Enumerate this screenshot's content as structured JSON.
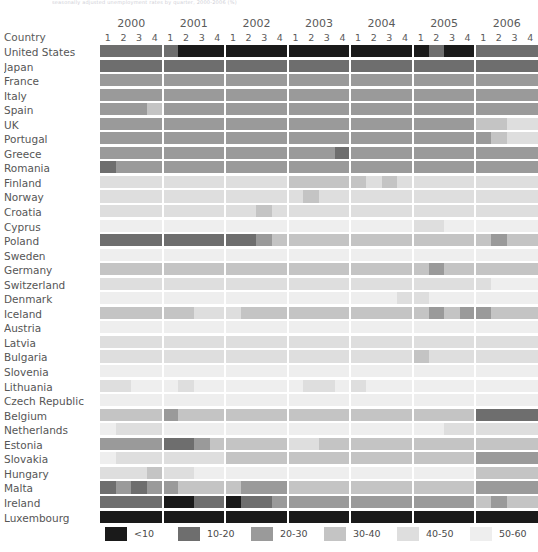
{
  "figure": {
    "cutoff_caption": "seasonally adjusted unemployment rates by quarter, 2000-2006 (%)",
    "row_header_label": "Country",
    "years": [
      "2000",
      "2001",
      "2002",
      "2003",
      "2004",
      "2005",
      "2006"
    ],
    "quarters": [
      "1",
      "2",
      "3",
      "4"
    ]
  },
  "legend": {
    "items": [
      {
        "label": "<10",
        "color": "#1a1a1a"
      },
      {
        "label": "10-20",
        "color": "#6e6e6e"
      },
      {
        "label": "20-30",
        "color": "#9a9a9a"
      },
      {
        "label": "30-40",
        "color": "#c4c4c4"
      },
      {
        "label": "40-50",
        "color": "#dedede"
      },
      {
        "label": "50-60",
        "color": "#eeeeee"
      }
    ]
  },
  "palette": {
    "b0": "#1a1a1a",
    "b1": "#6e6e6e",
    "b2": "#9a9a9a",
    "b3": "#c4c4c4",
    "b4": "#dedede",
    "b5": "#eeeeee",
    "b6": "#f7f7f7",
    "grid_background": "#ffffff"
  },
  "chart_data": {
    "type": "heatmap",
    "title": "Seasonally adjusted unemployment rates by quarter, 2000-2006 (%)",
    "xlabel": "",
    "ylabel": "Country",
    "legend_position": "bottom",
    "grid": true,
    "x": [
      "2000 Q1",
      "2000 Q2",
      "2000 Q3",
      "2000 Q4",
      "2001 Q1",
      "2001 Q2",
      "2001 Q3",
      "2001 Q4",
      "2002 Q1",
      "2002 Q2",
      "2002 Q3",
      "2002 Q4",
      "2003 Q1",
      "2003 Q2",
      "2003 Q3",
      "2003 Q4",
      "2004 Q1",
      "2004 Q2",
      "2004 Q3",
      "2004 Q4",
      "2005 Q1",
      "2005 Q2",
      "2005 Q3",
      "2005 Q4",
      "2006 Q1",
      "2006 Q2",
      "2006 Q3",
      "2006 Q4"
    ],
    "bins": [
      "<10",
      "10-20",
      "20-30",
      "30-40",
      "40-50",
      "50-60"
    ],
    "categories": [
      "United States",
      "Japan",
      "France",
      "Italy",
      "Spain",
      "UK",
      "Portugal",
      "Greece",
      "Romania",
      "Finland",
      "Norway",
      "Croatia",
      "Cyprus",
      "Poland",
      "Sweden",
      "Germany",
      "Switzerland",
      "Denmark",
      "Iceland",
      "Austria",
      "Latvia",
      "Bulgaria",
      "Slovenia",
      "Lithuania",
      "Czech Republic",
      "Belgium",
      "Netherlands",
      "Estonia",
      "Slovakia",
      "Hungary",
      "Malta",
      "Ireland",
      "Luxembourg"
    ],
    "rows": [
      {
        "country": "United States",
        "bins": [
          1,
          1,
          1,
          1,
          1,
          0,
          0,
          0,
          0,
          0,
          0,
          0,
          0,
          0,
          0,
          0,
          0,
          0,
          0,
          0,
          0,
          1,
          0,
          0,
          1,
          1,
          1,
          1
        ]
      },
      {
        "country": "Japan",
        "bins": [
          1,
          1,
          1,
          1,
          1,
          1,
          1,
          1,
          1,
          1,
          1,
          1,
          1,
          1,
          1,
          1,
          1,
          1,
          1,
          1,
          1,
          1,
          1,
          1,
          1,
          1,
          1,
          1
        ]
      },
      {
        "country": "France",
        "bins": [
          2,
          2,
          2,
          2,
          2,
          2,
          2,
          2,
          2,
          2,
          2,
          2,
          2,
          2,
          2,
          2,
          2,
          2,
          2,
          2,
          2,
          2,
          2,
          2,
          2,
          2,
          2,
          2
        ]
      },
      {
        "country": "Italy",
        "bins": [
          2,
          2,
          2,
          2,
          2,
          2,
          2,
          2,
          2,
          2,
          2,
          2,
          2,
          2,
          2,
          2,
          2,
          2,
          2,
          2,
          2,
          2,
          2,
          2,
          2,
          2,
          2,
          2
        ]
      },
      {
        "country": "Spain",
        "bins": [
          2,
          2,
          2,
          3,
          2,
          2,
          2,
          2,
          2,
          2,
          2,
          2,
          2,
          2,
          2,
          2,
          2,
          2,
          2,
          2,
          2,
          2,
          2,
          2,
          2,
          2,
          2,
          2
        ]
      },
      {
        "country": "UK",
        "bins": [
          2,
          2,
          2,
          2,
          2,
          2,
          2,
          2,
          2,
          2,
          2,
          2,
          2,
          2,
          2,
          2,
          2,
          2,
          2,
          2,
          2,
          2,
          2,
          2,
          3,
          3,
          4,
          4
        ]
      },
      {
        "country": "Portugal",
        "bins": [
          2,
          2,
          2,
          2,
          2,
          2,
          2,
          2,
          2,
          2,
          2,
          2,
          2,
          2,
          2,
          2,
          2,
          2,
          2,
          2,
          2,
          2,
          2,
          2,
          2,
          3,
          4,
          4
        ]
      },
      {
        "country": "Greece",
        "bins": [
          2,
          2,
          2,
          2,
          2,
          2,
          2,
          2,
          2,
          2,
          2,
          2,
          2,
          2,
          2,
          1,
          2,
          2,
          2,
          2,
          2,
          2,
          2,
          2,
          2,
          2,
          2,
          2
        ]
      },
      {
        "country": "Romania",
        "bins": [
          1,
          2,
          2,
          2,
          2,
          2,
          2,
          2,
          2,
          2,
          2,
          2,
          2,
          2,
          2,
          2,
          2,
          2,
          2,
          2,
          2,
          2,
          2,
          2,
          2,
          2,
          2,
          2
        ]
      },
      {
        "country": "Finland",
        "bins": [
          4,
          4,
          4,
          4,
          4,
          4,
          4,
          4,
          4,
          4,
          4,
          4,
          3,
          3,
          3,
          3,
          3,
          4,
          3,
          4,
          4,
          4,
          4,
          4,
          4,
          4,
          4,
          4
        ]
      },
      {
        "country": "Norway",
        "bins": [
          4,
          4,
          4,
          4,
          4,
          4,
          4,
          4,
          4,
          4,
          4,
          4,
          4,
          3,
          4,
          4,
          4,
          4,
          4,
          4,
          4,
          4,
          4,
          4,
          4,
          4,
          4,
          4
        ]
      },
      {
        "country": "Croatia",
        "bins": [
          4,
          4,
          4,
          4,
          4,
          4,
          4,
          4,
          4,
          4,
          3,
          4,
          4,
          4,
          4,
          4,
          4,
          4,
          4,
          4,
          4,
          4,
          4,
          4,
          4,
          4,
          4,
          4
        ]
      },
      {
        "country": "Cyprus",
        "bins": [
          5,
          5,
          5,
          5,
          5,
          5,
          5,
          5,
          5,
          5,
          5,
          5,
          5,
          5,
          5,
          5,
          5,
          5,
          5,
          5,
          4,
          4,
          5,
          5,
          5,
          5,
          5,
          5
        ]
      },
      {
        "country": "Poland",
        "bins": [
          1,
          1,
          1,
          1,
          1,
          1,
          1,
          1,
          1,
          1,
          2,
          3,
          3,
          3,
          3,
          3,
          3,
          3,
          3,
          3,
          3,
          3,
          3,
          3,
          3,
          2,
          3,
          3
        ]
      },
      {
        "country": "Sweden",
        "bins": [
          5,
          5,
          5,
          5,
          5,
          5,
          5,
          5,
          5,
          5,
          5,
          5,
          5,
          5,
          5,
          5,
          5,
          5,
          5,
          5,
          5,
          5,
          5,
          5,
          5,
          5,
          5,
          5
        ]
      },
      {
        "country": "Germany",
        "bins": [
          3,
          3,
          3,
          3,
          3,
          3,
          3,
          3,
          3,
          3,
          3,
          3,
          3,
          3,
          3,
          3,
          3,
          3,
          3,
          3,
          3,
          2,
          3,
          3,
          3,
          3,
          3,
          3
        ]
      },
      {
        "country": "Switzerland",
        "bins": [
          4,
          4,
          4,
          4,
          4,
          4,
          4,
          4,
          4,
          4,
          4,
          4,
          4,
          4,
          4,
          4,
          4,
          4,
          4,
          4,
          4,
          4,
          4,
          4,
          4,
          5,
          5,
          5
        ]
      },
      {
        "country": "Denmark",
        "bins": [
          5,
          5,
          5,
          5,
          5,
          5,
          5,
          5,
          5,
          5,
          5,
          5,
          5,
          5,
          5,
          5,
          5,
          5,
          5,
          4,
          4,
          5,
          5,
          5,
          5,
          5,
          5,
          5
        ]
      },
      {
        "country": "Iceland",
        "bins": [
          3,
          3,
          3,
          3,
          3,
          3,
          4,
          4,
          4,
          3,
          3,
          3,
          3,
          3,
          3,
          3,
          3,
          3,
          3,
          3,
          3,
          2,
          3,
          2,
          2,
          3,
          3,
          3
        ]
      },
      {
        "country": "Austria",
        "bins": [
          5,
          5,
          5,
          5,
          5,
          5,
          5,
          5,
          5,
          5,
          5,
          5,
          5,
          5,
          5,
          5,
          5,
          5,
          5,
          5,
          5,
          5,
          5,
          5,
          5,
          5,
          5,
          5
        ]
      },
      {
        "country": "Latvia",
        "bins": [
          4,
          4,
          4,
          4,
          4,
          4,
          4,
          4,
          4,
          4,
          4,
          4,
          4,
          4,
          4,
          4,
          4,
          4,
          4,
          4,
          4,
          4,
          4,
          4,
          4,
          4,
          4,
          4
        ]
      },
      {
        "country": "Bulgaria",
        "bins": [
          4,
          4,
          4,
          4,
          4,
          4,
          4,
          4,
          4,
          4,
          4,
          4,
          4,
          4,
          4,
          4,
          4,
          4,
          4,
          4,
          3,
          4,
          4,
          4,
          4,
          4,
          4,
          4
        ]
      },
      {
        "country": "Slovenia",
        "bins": [
          5,
          5,
          5,
          5,
          5,
          5,
          5,
          5,
          5,
          5,
          5,
          5,
          5,
          5,
          5,
          5,
          5,
          5,
          5,
          5,
          5,
          5,
          5,
          5,
          5,
          5,
          5,
          5
        ]
      },
      {
        "country": "Lithuania",
        "bins": [
          4,
          4,
          5,
          5,
          5,
          4,
          5,
          5,
          5,
          5,
          5,
          5,
          5,
          4,
          4,
          5,
          4,
          5,
          5,
          5,
          5,
          5,
          5,
          5,
          5,
          5,
          5,
          5
        ]
      },
      {
        "country": "Czech Republic",
        "bins": [
          5,
          5,
          5,
          5,
          5,
          5,
          5,
          5,
          5,
          5,
          5,
          5,
          5,
          5,
          5,
          5,
          5,
          5,
          5,
          5,
          5,
          5,
          5,
          5,
          5,
          5,
          5,
          5
        ]
      },
      {
        "country": "Belgium",
        "bins": [
          3,
          3,
          3,
          3,
          2,
          3,
          3,
          3,
          3,
          3,
          3,
          3,
          3,
          3,
          3,
          3,
          3,
          3,
          3,
          3,
          3,
          3,
          3,
          3,
          1,
          1,
          1,
          1
        ]
      },
      {
        "country": "Netherlands",
        "bins": [
          5,
          4,
          4,
          4,
          5,
          5,
          5,
          5,
          5,
          5,
          5,
          5,
          5,
          5,
          5,
          5,
          5,
          5,
          5,
          5,
          5,
          5,
          4,
          4,
          4,
          4,
          4,
          4
        ]
      },
      {
        "country": "Estonia",
        "bins": [
          2,
          2,
          2,
          2,
          1,
          1,
          2,
          3,
          3,
          3,
          3,
          3,
          4,
          4,
          3,
          3,
          3,
          3,
          3,
          3,
          3,
          3,
          3,
          3,
          3,
          3,
          3,
          3
        ]
      },
      {
        "country": "Slovakia",
        "bins": [
          5,
          4,
          4,
          4,
          4,
          4,
          4,
          4,
          3,
          3,
          3,
          3,
          3,
          3,
          3,
          3,
          3,
          3,
          3,
          3,
          3,
          3,
          3,
          3,
          2,
          2,
          2,
          2
        ]
      },
      {
        "country": "Hungary",
        "bins": [
          4,
          4,
          4,
          3,
          4,
          4,
          5,
          5,
          5,
          5,
          5,
          5,
          5,
          5,
          5,
          5,
          5,
          5,
          5,
          5,
          5,
          5,
          5,
          5,
          3,
          3,
          3,
          3
        ]
      },
      {
        "country": "Malta",
        "bins": [
          1,
          2,
          1,
          2,
          2,
          3,
          3,
          3,
          3,
          2,
          2,
          2,
          3,
          3,
          3,
          3,
          3,
          3,
          3,
          3,
          3,
          3,
          3,
          3,
          2,
          2,
          2,
          2
        ]
      },
      {
        "country": "Ireland",
        "bins": [
          1,
          1,
          1,
          1,
          0,
          0,
          1,
          1,
          0,
          1,
          1,
          2,
          2,
          2,
          2,
          2,
          2,
          2,
          2,
          2,
          2,
          2,
          2,
          2,
          3,
          2,
          3,
          3
        ]
      },
      {
        "country": "Luxembourg",
        "bins": [
          0,
          0,
          0,
          0,
          0,
          0,
          0,
          0,
          0,
          0,
          0,
          0,
          0,
          0,
          0,
          0,
          0,
          0,
          0,
          0,
          0,
          0,
          0,
          0,
          0,
          0,
          0,
          0
        ]
      }
    ]
  }
}
